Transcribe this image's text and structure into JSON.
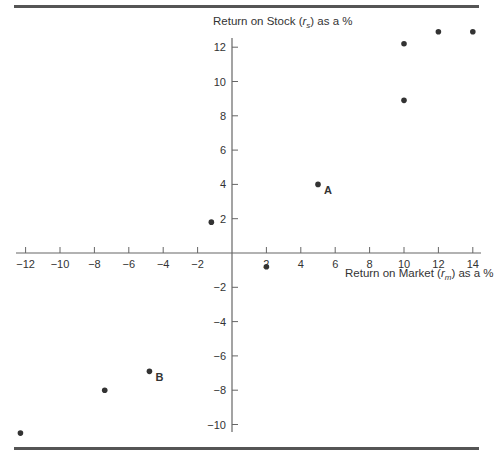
{
  "chart_data": {
    "type": "scatter",
    "title": "",
    "xlabel": "Return on Market (r_m) as a %",
    "ylabel": "Return on Stock (r_s) as a %",
    "xlabel_parts": {
      "pre": "Return on Market (",
      "var": "r",
      "sub": "m",
      "post": ") as a %"
    },
    "ylabel_parts": {
      "pre": "Return on Stock (",
      "var": "r",
      "sub": "s",
      "post": ") as a %"
    },
    "xlim": [
      -12,
      14
    ],
    "ylim": [
      -10,
      12
    ],
    "x_ticks": [
      -12,
      -10,
      -8,
      -6,
      -4,
      -2,
      2,
      4,
      6,
      8,
      10,
      12,
      14
    ],
    "y_ticks": [
      -10,
      -8,
      -6,
      -4,
      -2,
      2,
      4,
      6,
      8,
      10,
      12
    ],
    "grid": false,
    "points": [
      {
        "x": -12.3,
        "y": -10.5,
        "label": ""
      },
      {
        "x": -7.4,
        "y": -8.0,
        "label": ""
      },
      {
        "x": -4.8,
        "y": -6.9,
        "label": "B"
      },
      {
        "x": -1.2,
        "y": 1.8,
        "label": ""
      },
      {
        "x": 2.0,
        "y": -0.8,
        "label": ""
      },
      {
        "x": 5.0,
        "y": 4.0,
        "label": "A"
      },
      {
        "x": 10.0,
        "y": 8.9,
        "label": ""
      },
      {
        "x": 10.0,
        "y": 12.2,
        "label": ""
      },
      {
        "x": 12.0,
        "y": 12.9,
        "label": ""
      },
      {
        "x": 14.0,
        "y": 12.9,
        "label": ""
      }
    ],
    "colors": {
      "axis": "#666666",
      "point": "#333333",
      "text": "#333333",
      "rule": "#555555"
    }
  }
}
